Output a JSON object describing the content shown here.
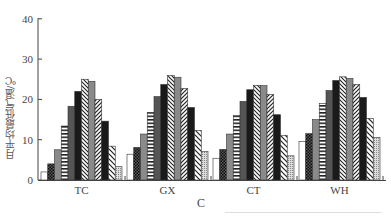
{
  "chart_data": {
    "type": "bar",
    "title": "",
    "xlabel": "C",
    "ylabel": "月平均最低气温/℃",
    "ylim": [
      0,
      40
    ],
    "yticks": [
      0,
      10,
      20,
      30,
      40
    ],
    "grid": false,
    "legend": "none",
    "categories": [
      "TC",
      "GX",
      "CT",
      "WH"
    ],
    "series": [
      {
        "name": "1",
        "pattern": "white",
        "values": [
          2.0,
          6.4,
          5.4,
          9.6
        ]
      },
      {
        "name": "2",
        "pattern": "dark-grid",
        "values": [
          4.0,
          8.1,
          7.6,
          11.5
        ]
      },
      {
        "name": "3",
        "pattern": "gray",
        "values": [
          7.5,
          11.4,
          11.4,
          15.0
        ]
      },
      {
        "name": "4",
        "pattern": "horizontal-ladder",
        "values": [
          13.4,
          16.8,
          16.0,
          19.0
        ]
      },
      {
        "name": "5",
        "pattern": "dark-gray",
        "values": [
          18.3,
          20.7,
          19.5,
          22.2
        ]
      },
      {
        "name": "6",
        "pattern": "black",
        "values": [
          22.0,
          23.7,
          22.4,
          24.7
        ]
      },
      {
        "name": "7",
        "pattern": "zigzag-hatch",
        "values": [
          25.0,
          25.9,
          23.5,
          25.6
        ]
      },
      {
        "name": "8",
        "pattern": "gray",
        "values": [
          24.5,
          25.5,
          23.4,
          25.2
        ]
      },
      {
        "name": "9",
        "pattern": "diagonal-hatch",
        "values": [
          20.0,
          22.7,
          21.2,
          23.7
        ]
      },
      {
        "name": "10",
        "pattern": "black",
        "values": [
          14.6,
          18.0,
          16.2,
          20.5
        ]
      },
      {
        "name": "11",
        "pattern": "wide-diagonal-hatch",
        "values": [
          8.4,
          12.3,
          11.1,
          15.3
        ]
      },
      {
        "name": "12",
        "pattern": "light-grid",
        "values": [
          3.3,
          7.1,
          6.0,
          10.6
        ]
      }
    ]
  },
  "axis": {
    "x_title": "C",
    "y_title": "月平均最低气温/℃",
    "y_tick_labels": [
      "0",
      "10",
      "20",
      "30",
      "40"
    ],
    "x_tick_labels": [
      "TC",
      "GX",
      "CT",
      "WH"
    ]
  }
}
